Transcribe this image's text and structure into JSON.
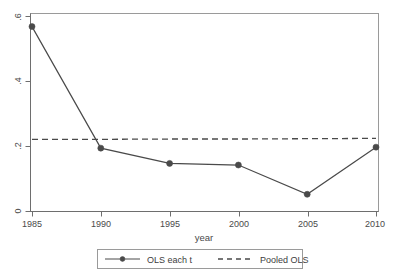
{
  "chart_data": {
    "type": "line",
    "title": "",
    "xlabel": "year",
    "ylabel": "",
    "x": [
      1985,
      1990,
      1995,
      2000,
      2005,
      2010
    ],
    "xlim": [
      1985,
      2010
    ],
    "ylim": [
      0,
      0.63
    ],
    "grid": false,
    "legend_position": "bottom",
    "xticks": [
      "1985",
      "1990",
      "1995",
      "2000",
      "2005",
      "2010"
    ],
    "xtick_values": [
      1985,
      1990,
      1995,
      2000,
      2005,
      2010
    ],
    "yticks": [
      "0",
      ".2",
      ".4",
      ".6"
    ],
    "ytick_values": [
      0,
      0.2,
      0.4,
      0.6
    ],
    "series": [
      {
        "name": "OLS each t",
        "style": "solid",
        "marker": "circle",
        "values": [
          0.569,
          0.195,
          0.148,
          0.143,
          0.053,
          0.198
        ]
      },
      {
        "name": "Pooled OLS",
        "style": "dashed",
        "marker": "none",
        "values": [
          0.222,
          0.222,
          0.223,
          0.223,
          0.224,
          0.225
        ]
      }
    ]
  },
  "axes": {
    "x_title": "year",
    "x_tick_labels": [
      "1985",
      "1990",
      "1995",
      "2000",
      "2005",
      "2010"
    ],
    "y_tick_labels": [
      "0",
      ".2",
      ".4",
      ".6"
    ]
  },
  "legend": {
    "entries": [
      {
        "label": "OLS each t",
        "style": "solid-marker"
      },
      {
        "label": "Pooled OLS",
        "style": "dashed"
      }
    ]
  },
  "colors": {
    "line": "#4a4a4a",
    "frame": "#9a9a9a",
    "background": "#ffffff"
  }
}
